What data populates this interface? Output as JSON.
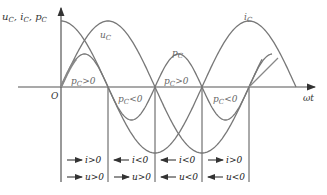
{
  "diagram": {
    "y_axis_label": {
      "u": "u",
      "u_sub": "C",
      "i": "i",
      "i_sub": "C",
      "p": "p",
      "p_sub": "C",
      "sep": ","
    },
    "x_axis_label": "ωt",
    "origin_label": "O",
    "curves": [
      {
        "name": "u_C",
        "label": "u",
        "sub": "C",
        "shape": "sine",
        "color": "#777777"
      },
      {
        "name": "i_C",
        "label": "i",
        "sub": "C",
        "shape": "cosine",
        "color": "#777777"
      },
      {
        "name": "p_C",
        "label": "p",
        "sub": "C",
        "shape": "double-frequency sine",
        "color": "#777777"
      }
    ],
    "region_annotations": [
      {
        "p": "p",
        "sub": "C",
        "rel": ">0"
      },
      {
        "p": "p",
        "sub": "C",
        "rel": "<0"
      },
      {
        "p": "p",
        "sub": "C",
        "rel": ">0"
      },
      {
        "p": "p",
        "sub": "C",
        "rel": "<0"
      }
    ],
    "quarters": [
      {
        "i_dir": "right",
        "i_text": "i>0",
        "u_dir": "right",
        "u_text": "u>0"
      },
      {
        "i_dir": "left",
        "i_text": "i<0",
        "u_dir": "right",
        "u_text": "u>0"
      },
      {
        "i_dir": "left",
        "i_text": "i<0",
        "u_dir": "left",
        "u_text": "u<0"
      },
      {
        "i_dir": "right",
        "i_text": "i>0",
        "u_dir": "left",
        "u_text": "u<0"
      }
    ]
  }
}
